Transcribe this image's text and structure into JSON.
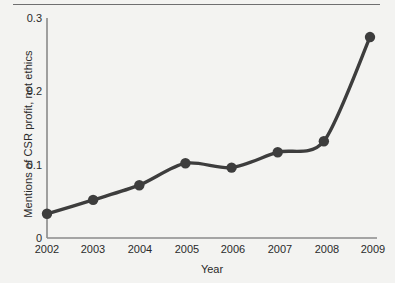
{
  "chart_data": {
    "type": "line",
    "title": "",
    "xlabel": "Year",
    "ylabel": "Mentions of CSR profit, not ethics",
    "categories": [
      "2002",
      "2003",
      "2004",
      "2005",
      "2006",
      "2007",
      "2008",
      "2009"
    ],
    "values": [
      0.033,
      0.052,
      0.072,
      0.102,
      0.096,
      0.117,
      0.132,
      0.274
    ],
    "series": [
      {
        "name": "Mentions of CSR profit, not ethics",
        "values": [
          0.033,
          0.052,
          0.072,
          0.102,
          0.096,
          0.117,
          0.132,
          0.274
        ]
      }
    ],
    "x": [
      2002,
      2003,
      2004,
      2005,
      2006,
      2007,
      2008,
      2009
    ],
    "ylim": [
      0,
      0.3
    ],
    "xlim": [
      2002,
      2009
    ],
    "ytick_labels": [
      "0",
      "0.1",
      "0.2",
      "0.3"
    ],
    "ytick_values": [
      0,
      0.1,
      0.2,
      0.3
    ],
    "xtick_labels": [
      "2002",
      "2003",
      "2004",
      "2005",
      "2006",
      "2007",
      "2008",
      "2009"
    ],
    "grid": false,
    "legend": false,
    "legend_position": "none",
    "marker": "circle",
    "line_color": "#3d3d3d",
    "marker_color": "#3d3d3d",
    "axis_color": "#8a8a8a",
    "background_color": "#f3f3f1",
    "annotations": []
  },
  "figure": {
    "top_rule_color": "#6f6f70"
  }
}
